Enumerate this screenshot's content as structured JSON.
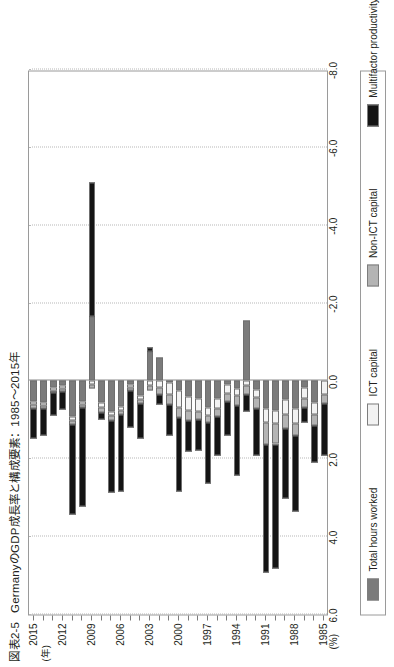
{
  "figure": {
    "number": "図表2-5",
    "title": "GermanyのGDP成長率と構成要素：1985〜2015年"
  },
  "axes": {
    "value_axis_unit": "(%)",
    "value_ticks": [
      "6.0",
      "4.0",
      "2.0",
      "0.0",
      "-2.0",
      "-4.0",
      "-6.0",
      "-8.0"
    ],
    "value_min": -8.0,
    "value_max": 6.0,
    "category_axis_unit": "(年)",
    "category_ticks": [
      "1985",
      "1988",
      "1991",
      "1994",
      "1997",
      "2000",
      "2003",
      "2006",
      "2009",
      "2012",
      "2015"
    ]
  },
  "legend": {
    "items": [
      {
        "label": "Total hours worked",
        "color": "#7b7b7b"
      },
      {
        "label": "ICT capital",
        "color": "#f2f2f2"
      },
      {
        "label": "Non-ICT capital",
        "color": "#b4b4b4"
      },
      {
        "label": "Multifactor productivity",
        "color": "#141414"
      }
    ]
  },
  "chart_data": {
    "type": "bar",
    "orientation": "horizontal-rotated",
    "stacked": true,
    "title": "GermanyのGDP成長率と構成要素：1985〜2015年",
    "xlabel": "(年)",
    "ylabel": "(%)",
    "ylim": [
      -8.0,
      6.0
    ],
    "grid": true,
    "legend_position": "below-plot",
    "categories": [
      "1985",
      "1986",
      "1987",
      "1988",
      "1989",
      "1990",
      "1991",
      "1992",
      "1993",
      "1994",
      "1995",
      "1996",
      "1997",
      "1998",
      "1999",
      "2000",
      "2001",
      "2002",
      "2003",
      "2004",
      "2005",
      "2006",
      "2007",
      "2008",
      "2009",
      "2010",
      "2011",
      "2012",
      "2013",
      "2014",
      "2015"
    ],
    "series": [
      {
        "name": "Total hours worked",
        "color": "#7b7b7b",
        "values": [
          0.0,
          0.55,
          0.18,
          0.7,
          0.48,
          0.75,
          0.7,
          0.22,
          -1.55,
          0.2,
          0.1,
          0.45,
          0.68,
          0.46,
          0.4,
          0.25,
          0.04,
          -0.6,
          -0.75,
          0.38,
          0.08,
          0.65,
          0.78,
          0.55,
          -1.65,
          0.52,
          0.92,
          0.12,
          0.18,
          0.55,
          0.52
        ]
      },
      {
        "name": "ICT capital",
        "color": "#f2f2f2",
        "values": [
          0.35,
          0.3,
          0.28,
          0.4,
          0.38,
          0.35,
          0.38,
          0.2,
          0.12,
          0.18,
          0.22,
          0.26,
          0.22,
          0.32,
          0.35,
          0.42,
          0.3,
          0.18,
          0.12,
          0.1,
          0.08,
          0.1,
          0.12,
          0.12,
          0.1,
          0.08,
          0.1,
          0.08,
          0.06,
          0.08,
          0.08
        ]
      },
      {
        "name": "Non-ICT capital",
        "color": "#b4b4b4",
        "values": [
          0.22,
          0.3,
          0.22,
          0.3,
          0.36,
          0.52,
          0.55,
          0.3,
          0.22,
          0.24,
          0.22,
          0.2,
          0.18,
          0.22,
          0.26,
          0.28,
          0.26,
          0.18,
          0.12,
          0.1,
          0.08,
          0.1,
          0.12,
          0.14,
          0.1,
          0.08,
          0.1,
          0.08,
          0.06,
          0.08,
          0.1
        ]
      },
      {
        "name": "Multifactor productivity",
        "color": "#141414",
        "values": [
          1.35,
          0.95,
          0.4,
          1.95,
          1.8,
          3.2,
          3.3,
          1.2,
          0.45,
          1.8,
          0.85,
          1.0,
          1.55,
          0.8,
          0.8,
          1.9,
          0.8,
          0.25,
          -0.1,
          0.9,
          0.95,
          2.0,
          1.85,
          0.18,
          -3.45,
          2.55,
          2.3,
          0.45,
          0.58,
          0.68,
          0.78
        ]
      }
    ],
    "totals": [
      1.92,
      2.1,
      1.08,
      3.35,
      3.02,
      4.82,
      4.93,
      1.92,
      -0.76,
      2.42,
      1.39,
      1.91,
      2.63,
      1.8,
      1.81,
      2.85,
      1.4,
      0.01,
      -0.61,
      1.48,
      1.19,
      2.85,
      2.87,
      0.99,
      -4.9,
      3.23,
      3.42,
      0.73,
      0.88,
      1.39,
      1.48
    ]
  }
}
